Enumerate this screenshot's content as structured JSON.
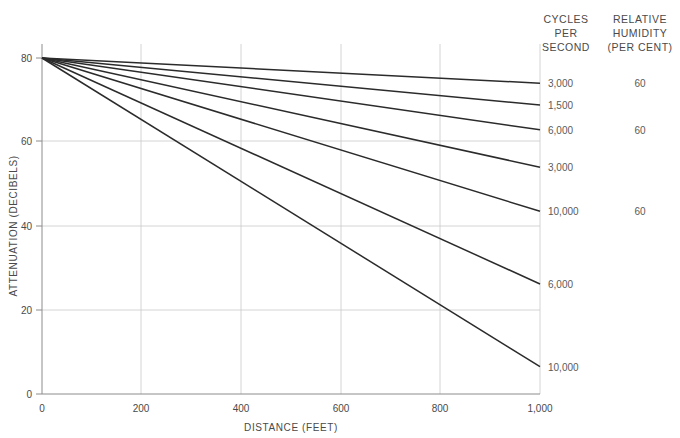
{
  "chart_data": {
    "type": "line",
    "title": "",
    "xlabel": "DISTANCE (FEET)",
    "ylabel": "ATTENUATION (DECIBELS)",
    "xlim": [
      0,
      1000
    ],
    "ylim": [
      0,
      80
    ],
    "xticks": [
      0,
      200,
      400,
      600,
      800,
      1000
    ],
    "xtick_labels": [
      "0",
      "200",
      "400",
      "600",
      "800",
      "1,000"
    ],
    "yticks": [
      0,
      20,
      40,
      60,
      80
    ],
    "ytick_labels": [
      "0",
      "20",
      "40",
      "60",
      "80"
    ],
    "grid": true,
    "grid_axis": "both",
    "legend_position": "right-columns",
    "series": [
      {
        "name": "3,000",
        "frequency_label": "3,000",
        "humidity": "60",
        "x": [
          0,
          1000
        ],
        "values": [
          80,
          74.0
        ]
      },
      {
        "name": "1,500",
        "frequency_label": "1,500",
        "humidity": "",
        "x": [
          0,
          1000
        ],
        "values": [
          80,
          68.8
        ]
      },
      {
        "name": "6,000-a",
        "frequency_label": "6,000",
        "humidity": "60",
        "x": [
          0,
          1000
        ],
        "values": [
          80,
          62.9
        ]
      },
      {
        "name": "3,000-b",
        "frequency_label": "3,000",
        "humidity": "",
        "x": [
          0,
          1000
        ],
        "values": [
          80,
          54.0
        ]
      },
      {
        "name": "10,000-a",
        "frequency_label": "10,000",
        "humidity": "60",
        "x": [
          0,
          1000
        ],
        "values": [
          80,
          43.5
        ]
      },
      {
        "name": "6,000-b",
        "frequency_label": "6,000",
        "humidity": "",
        "x": [
          0,
          1000
        ],
        "values": [
          80,
          26.2
        ]
      },
      {
        "name": "10,000-b",
        "frequency_label": "10,000",
        "humidity": "",
        "x": [
          0,
          1000
        ],
        "values": [
          80,
          6.5
        ]
      }
    ]
  },
  "legend": {
    "column_headers": {
      "frequency": [
        "CYCLES",
        "PER",
        "SECOND"
      ],
      "humidity": [
        "RELATIVE",
        "HUMIDITY",
        "(PER CENT)"
      ]
    },
    "rows": [
      {
        "frequency": "3,000",
        "humidity": "60"
      },
      {
        "frequency": "1,500",
        "humidity": ""
      },
      {
        "frequency": "6,000",
        "humidity": "60"
      },
      {
        "frequency": "3,000",
        "humidity": ""
      },
      {
        "frequency": "10,000",
        "humidity": "60"
      },
      {
        "frequency": "6,000",
        "humidity": ""
      },
      {
        "frequency": "10,000",
        "humidity": ""
      }
    ]
  },
  "colors": {
    "curve": "#2b2b2b",
    "axis": "#8c8c8c",
    "grid": "#c9c9c9",
    "text": "#4a4a4a",
    "background": "#ffffff"
  }
}
